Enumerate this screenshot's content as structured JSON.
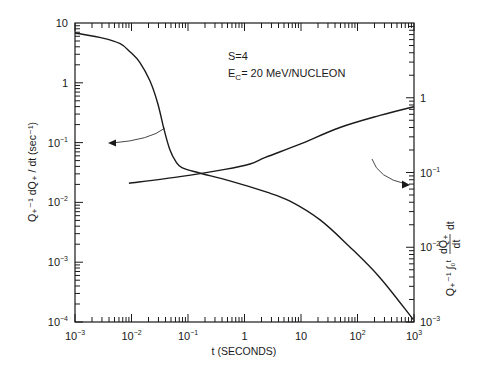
{
  "chart_data": {
    "type": "line",
    "title": "",
    "annotations": [
      "S=4",
      "E_C=20 MeV/NUCLEON"
    ],
    "xlabel": "t (SECONDS)",
    "ylabel_left": "Q+^-1 dQ+/dt (sec^-1)",
    "ylabel_right": "Q+^-1 ∫0^t (dQ+/dt) dt",
    "xscale": "log",
    "yscale": "log",
    "xlim": [
      0.001,
      1000
    ],
    "ylim_left": [
      0.0001,
      10
    ],
    "ylim_right": [
      0.001,
      10
    ],
    "x_tick_labels": [
      "10^-3",
      "10^-2",
      "10^-1",
      "1",
      "10",
      "10^2",
      "10^3"
    ],
    "y_left_tick_labels": [
      "10",
      "1",
      "10^-1",
      "10^-2",
      "10^-3",
      "10^-4"
    ],
    "y_right_tick_labels": [
      "1",
      "10^-1",
      "10^-2",
      "10^-3"
    ],
    "grid": false,
    "legend": "none (arrows indicate which axis each curve uses)",
    "series": [
      {
        "name": "Q+^-1 dQ+/dt (left axis)",
        "axis": "left",
        "x": [
          0.001,
          0.0031,
          0.0063,
          0.0094,
          0.014,
          0.021,
          0.029,
          0.038,
          0.048,
          0.061,
          0.078,
          0.16,
          0.55,
          2.4,
          6.4,
          21.8,
          73,
          250,
          970
        ],
        "values": [
          6.8,
          5.6,
          4.5,
          3.3,
          2.2,
          1.1,
          0.46,
          0.16,
          0.075,
          0.048,
          0.038,
          0.031,
          0.023,
          0.015,
          0.0105,
          0.0051,
          0.0018,
          0.00055,
          0.00011
        ]
      },
      {
        "name": "Q+^-1 ∫ dQ+/dt dt (right axis)",
        "axis": "right",
        "x": [
          0.009,
          0.072,
          0.45,
          1.25,
          2.4,
          9.6,
          49,
          250,
          1000
        ],
        "values": [
          0.072,
          0.088,
          0.11,
          0.13,
          0.16,
          0.24,
          0.4,
          0.58,
          0.76
        ]
      }
    ]
  },
  "labels": {
    "annot_s": "S=4",
    "annot_ec_main": "E",
    "annot_ec_sub": "C",
    "annot_ec_rest": "= 20 MeV/NUCLEON",
    "xlabel": "t (SECONDS)",
    "ylabel_left": "Q₊⁻¹ dQ₊ / dt  (sec⁻¹)",
    "ylabel_right_pre": "Q₊⁻¹ ∫₀ᵗ",
    "ylabel_right_num": "dQ₊",
    "ylabel_right_den": "dt",
    "ylabel_right_post": "dt"
  }
}
